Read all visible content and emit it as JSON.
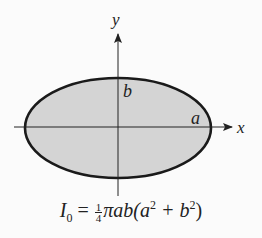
{
  "diagram": {
    "type": "ellipse-moment-of-inertia",
    "axes": {
      "x_label": "x",
      "y_label": "y"
    },
    "ellipse": {
      "semi_major_label": "a",
      "semi_minor_label": "b",
      "fill": "#d4d4d4",
      "stroke": "#1a1a1a"
    },
    "formula": {
      "lhs": "I",
      "lhs_sub": "0",
      "eq": "=",
      "frac_num": "1",
      "frac_den": "4",
      "rhs_a": "πab(a",
      "exp1": "2",
      "rhs_b": " + b",
      "exp2": "2",
      "rhs_c": ")"
    }
  }
}
